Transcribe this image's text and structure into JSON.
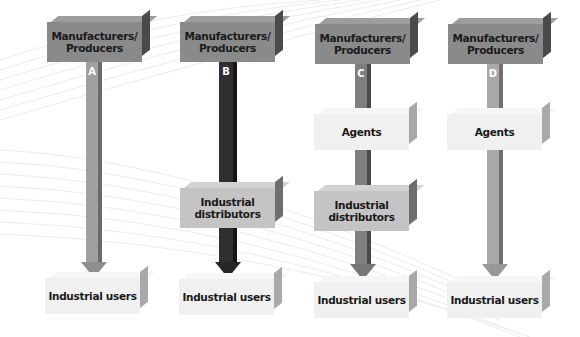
{
  "diagram": {
    "columns": [
      {
        "id": "A",
        "label": "A",
        "arrow_color": "#a0a0a0",
        "arrow_edge": "#6a6a6a",
        "nodes": [
          {
            "label": "Manufacturers/ Producers",
            "line1": "Manufacturers/",
            "line2": "Producers"
          },
          {
            "label": "Industrial users"
          }
        ]
      },
      {
        "id": "B",
        "label": "B",
        "arrow_color": "#2f2f2f",
        "arrow_edge": "#151515",
        "nodes": [
          {
            "label": "Manufacturers/ Producers",
            "line1": "Manufacturers/",
            "line2": "Producers"
          },
          {
            "label": "Industrial distributors",
            "line1": "Industrial",
            "line2": "distributors"
          },
          {
            "label": "Industrial users"
          }
        ]
      },
      {
        "id": "C",
        "label": "C",
        "arrow_color": "#7f7f7f",
        "arrow_edge": "#4a4a4a",
        "nodes": [
          {
            "label": "Manufacturers/ Producers",
            "line1": "Manufacturers/",
            "line2": "Producers"
          },
          {
            "label": "Agents"
          },
          {
            "label": "Industrial distributors",
            "line1": "Industrial",
            "line2": "distributors"
          },
          {
            "label": "Industrial users"
          }
        ]
      },
      {
        "id": "D",
        "label": "D",
        "arrow_color": "#a8a8a8",
        "arrow_edge": "#707070",
        "nodes": [
          {
            "label": "Manufacturers/ Producers",
            "line1": "Manufacturers/",
            "line2": "Producers"
          },
          {
            "label": "Agents"
          },
          {
            "label": "Industrial users"
          }
        ]
      }
    ]
  }
}
